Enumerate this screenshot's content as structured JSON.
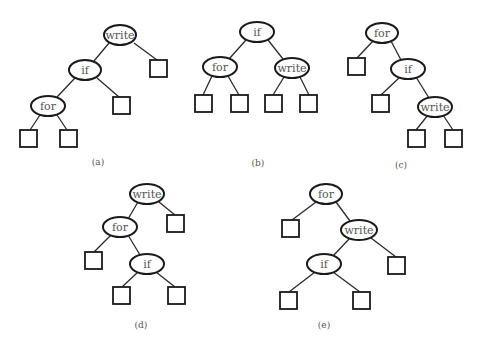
{
  "figure": {
    "trees": [
      {
        "id": "a",
        "caption": "(a)",
        "nodes": [
          {
            "id": "a-write",
            "label": "write",
            "cx": 120,
            "cy": 35
          },
          {
            "id": "a-if",
            "label": "if",
            "cx": 85,
            "cy": 70
          },
          {
            "id": "a-for",
            "label": "for",
            "cx": 48,
            "cy": 106
          }
        ],
        "leaves": [
          {
            "x": 150,
            "y": 60
          },
          {
            "x": 113,
            "y": 97
          },
          {
            "x": 20,
            "y": 130
          },
          {
            "x": 60,
            "y": 130
          }
        ],
        "caption_pos": {
          "x": 98,
          "y": 162
        }
      },
      {
        "id": "b",
        "caption": "(b)",
        "nodes": [
          {
            "id": "b-if",
            "label": "if",
            "cx": 257,
            "cy": 32
          },
          {
            "id": "b-for",
            "label": "for",
            "cx": 220,
            "cy": 67
          },
          {
            "id": "b-write",
            "label": "write",
            "cx": 292,
            "cy": 68
          }
        ],
        "leaves": [
          {
            "x": 195,
            "y": 95
          },
          {
            "x": 231,
            "y": 95
          },
          {
            "x": 265,
            "y": 95
          },
          {
            "x": 300,
            "y": 95
          }
        ],
        "caption_pos": {
          "x": 258,
          "y": 163
        }
      },
      {
        "id": "c",
        "caption": "(c)",
        "nodes": [
          {
            "id": "c-for",
            "label": "for",
            "cx": 382,
            "cy": 33
          },
          {
            "id": "c-if",
            "label": "if",
            "cx": 408,
            "cy": 69
          },
          {
            "id": "c-write",
            "label": "write",
            "cx": 435,
            "cy": 107
          }
        ],
        "leaves": [
          {
            "x": 348,
            "y": 58
          },
          {
            "x": 372,
            "y": 95
          },
          {
            "x": 408,
            "y": 130
          },
          {
            "x": 445,
            "y": 130
          }
        ],
        "caption_pos": {
          "x": 401,
          "y": 165
        }
      },
      {
        "id": "d",
        "caption": "(d)",
        "nodes": [
          {
            "id": "d-write",
            "label": "write",
            "cx": 147,
            "cy": 194
          },
          {
            "id": "d-for",
            "label": "for",
            "cx": 120,
            "cy": 227
          },
          {
            "id": "d-if",
            "label": "if",
            "cx": 147,
            "cy": 264
          }
        ],
        "leaves": [
          {
            "x": 167,
            "y": 215
          },
          {
            "x": 85,
            "y": 252
          },
          {
            "x": 113,
            "y": 287
          },
          {
            "x": 168,
            "y": 287
          }
        ],
        "caption_pos": {
          "x": 141,
          "y": 325
        }
      },
      {
        "id": "e",
        "caption": "(e)",
        "nodes": [
          {
            "id": "e-for",
            "label": "for",
            "cx": 326,
            "cy": 194
          },
          {
            "id": "e-write",
            "label": "write",
            "cx": 359,
            "cy": 230
          },
          {
            "id": "e-if",
            "label": "if",
            "cx": 324,
            "cy": 264
          }
        ],
        "leaves": [
          {
            "x": 282,
            "y": 220
          },
          {
            "x": 388,
            "y": 257
          },
          {
            "x": 280,
            "y": 292
          },
          {
            "x": 353,
            "y": 292
          }
        ],
        "caption_pos": {
          "x": 324,
          "y": 325
        }
      }
    ]
  },
  "labels": {
    "a": {
      "write": "write",
      "if": "if",
      "for": "for",
      "caption": "(a)"
    },
    "b": {
      "if": "if",
      "for": "for",
      "write": "write",
      "caption": "(b)"
    },
    "c": {
      "for": "for",
      "if": "if",
      "write": "write",
      "caption": "(c)"
    },
    "d": {
      "write": "write",
      "for": "for",
      "if": "if",
      "caption": "(d)"
    },
    "e": {
      "for": "for",
      "write": "write",
      "if": "if",
      "caption": "(e)"
    }
  }
}
